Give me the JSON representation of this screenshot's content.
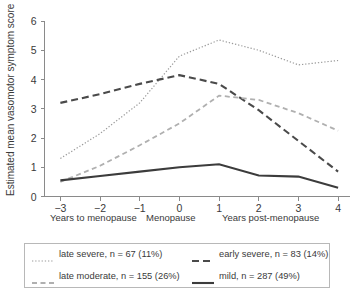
{
  "chart_data": {
    "type": "line",
    "title": "",
    "xlabel": "",
    "ylabel": "Estimated mean vasomotor symptom score",
    "x": [
      -3,
      -2,
      -1,
      0,
      1,
      2,
      3,
      4
    ],
    "xticklabels": [
      "−3",
      "−2",
      "−1",
      "0",
      "1",
      "2",
      "3",
      "4"
    ],
    "yticklabels": [
      "0",
      "1",
      "2",
      "3",
      "4",
      "5",
      "6"
    ],
    "xlim": [
      -3.4,
      4.3
    ],
    "ylim": [
      0,
      6
    ],
    "grid": false,
    "legend_position": "below-plot",
    "axis_captions": {
      "left": "Years to menopause",
      "center": "Menopause",
      "right": "Years post-menopause"
    },
    "series": [
      {
        "name": "late severe, n = 67 (11%)",
        "key": "late-severe",
        "style": "dotted",
        "color": "#9a9a9a",
        "width": 1.2,
        "dasharray": "1.3,1.9",
        "x": [
          -3,
          -2,
          -1,
          0,
          1,
          2,
          3,
          4
        ],
        "values": [
          1.3,
          2.15,
          3.2,
          4.8,
          5.35,
          5.0,
          4.5,
          4.65
        ]
      },
      {
        "name": "early severe, n = 83 (14%)",
        "key": "early-severe",
        "style": "long-dashed",
        "color": "#4a4a4a",
        "width": 2.1,
        "dasharray": "7,4",
        "x": [
          -3,
          -2,
          -1,
          0,
          1,
          2,
          3,
          4
        ],
        "values": [
          3.2,
          3.5,
          3.85,
          4.15,
          3.85,
          2.95,
          1.9,
          0.85
        ]
      },
      {
        "name": "late moderate, n = 155 (26%)",
        "key": "late-moderate",
        "style": "short-dashed",
        "color": "#b0b0b0",
        "width": 1.8,
        "dasharray": "5,3.5",
        "x": [
          -3,
          -2,
          -1,
          0,
          1,
          2,
          3,
          4
        ],
        "values": [
          0.5,
          1.05,
          1.75,
          2.5,
          3.45,
          3.3,
          2.85,
          2.25
        ]
      },
      {
        "name": "mild, n = 287 (49%)",
        "key": "mild",
        "style": "solid",
        "color": "#3c3c3c",
        "width": 2.1,
        "dasharray": "none",
        "x": [
          -3,
          -2,
          -1,
          0,
          1,
          2,
          3,
          4
        ],
        "values": [
          0.55,
          0.7,
          0.85,
          1.0,
          1.1,
          0.72,
          0.68,
          0.3
        ]
      }
    ],
    "legend_entries": [
      {
        "label": "late severe, n = 67 (11%)",
        "key": "late-severe",
        "color": "#9a9a9a",
        "dasharray": "1.3,1.9",
        "width": 1.2
      },
      {
        "label": "early severe, n = 83 (14%)",
        "key": "early-severe",
        "color": "#4a4a4a",
        "dasharray": "7,4",
        "width": 2.1
      },
      {
        "label": "late moderate, n = 155 (26%)",
        "key": "late-moderate",
        "color": "#b0b0b0",
        "dasharray": "5,3.5",
        "width": 1.8
      },
      {
        "label": "mild, n = 287 (49%)",
        "key": "mild",
        "color": "#3c3c3c",
        "dasharray": "none",
        "width": 2.1
      }
    ]
  }
}
